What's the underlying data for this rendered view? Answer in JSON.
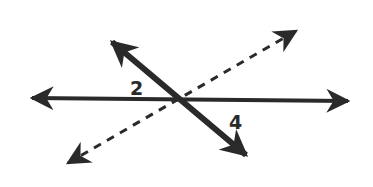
{
  "diagram": {
    "type": "intersecting-lines",
    "colors": {
      "background": "#ffffff",
      "ink": "#2a2a2a"
    },
    "lines": [
      {
        "name": "horizontal-line",
        "style": "solid",
        "weight": "medium",
        "arrows": "both",
        "from": [
          30,
          98
        ],
        "to": [
          350,
          101
        ]
      },
      {
        "name": "diagonal-thick-line",
        "style": "solid",
        "weight": "thick",
        "arrows": "both",
        "from": [
          110,
          40
        ],
        "to": [
          248,
          157
        ]
      },
      {
        "name": "dashed-line",
        "style": "dashed",
        "weight": "thin",
        "arrows": "both",
        "from": [
          65,
          165
        ],
        "to": [
          298,
          30
        ]
      }
    ],
    "intersection": [
      180,
      99
    ],
    "angle_labels": [
      {
        "text": "2",
        "x": 130,
        "y": 95
      },
      {
        "text": "4",
        "x": 229,
        "y": 129
      }
    ]
  }
}
